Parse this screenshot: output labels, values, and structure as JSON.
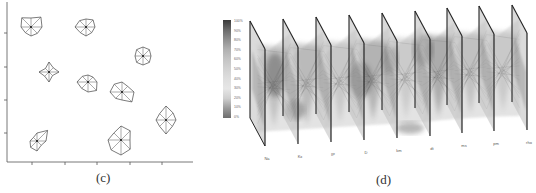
{
  "panels": {
    "c": {
      "label": "(c)",
      "type": "star-glyph scatter",
      "axes": {
        "x_ticks_px": [
          32,
          65,
          97,
          130,
          162
        ],
        "y_ticks_px": [
          33,
          67,
          100,
          133
        ]
      },
      "glyphs": [
        {
          "cx": 31,
          "cy": 27,
          "r": [
            9,
            14,
            11,
            9,
            9,
            8,
            10,
            13
          ]
        },
        {
          "cx": 86,
          "cy": 27,
          "r": [
            8,
            10,
            9,
            8,
            9,
            8,
            11,
            9
          ]
        },
        {
          "cx": 49,
          "cy": 72,
          "r": [
            10,
            6,
            10,
            5,
            10,
            6,
            10,
            5
          ]
        },
        {
          "cx": 88,
          "cy": 82,
          "r": [
            7,
            7,
            9,
            12,
            10,
            9,
            11,
            8
          ]
        },
        {
          "cx": 122,
          "cy": 92,
          "r": [
            10,
            8,
            12,
            14,
            8,
            9,
            12,
            11
          ]
        },
        {
          "cx": 143,
          "cy": 56,
          "r": [
            9,
            9,
            8,
            9,
            9,
            9,
            8,
            9
          ]
        },
        {
          "cx": 166,
          "cy": 120,
          "r": [
            14,
            10,
            10,
            9,
            14,
            9,
            10,
            9
          ]
        },
        {
          "cx": 37,
          "cy": 141,
          "r": [
            8,
            15,
            9,
            6,
            10,
            9,
            7,
            5
          ]
        },
        {
          "cx": 121,
          "cy": 140,
          "r": [
            14,
            13,
            9,
            13,
            15,
            14,
            13,
            10
          ]
        }
      ]
    },
    "d": {
      "label": "(d)",
      "type": "3D parallel coordinates with density planes",
      "legend": {
        "ticks": [
          "100%",
          "90%",
          "80%",
          "70%",
          "60%",
          "50%",
          "40%",
          "30%",
          "20%",
          "10%",
          "0%"
        ],
        "gradient": [
          "#3a3a3a",
          "#6a6a6a",
          "#8f8f8f",
          "#b0b0b0",
          "#c4c4c4",
          "#d2d2d2",
          "#dedede",
          "#e6e6e6",
          "#cfcfcf",
          "#9a9a9a",
          "#6e6e6e"
        ]
      },
      "axes": [
        {
          "label": "Na",
          "x": 250,
          "top": 21
        },
        {
          "label": "Kx",
          "x": 283,
          "top": 19
        },
        {
          "label": "IP",
          "x": 316,
          "top": 17
        },
        {
          "label": "D",
          "x": 349,
          "top": 15
        },
        {
          "label": "km",
          "x": 382,
          "top": 13
        },
        {
          "label": "dt",
          "x": 415,
          "top": 11
        },
        {
          "label": "ms",
          "x": 447,
          "top": 8
        },
        {
          "label": "pm",
          "x": 479,
          "top": 6
        },
        {
          "label": "rho",
          "x": 512,
          "top": 5
        }
      ],
      "plane_depth": {
        "dx": 15,
        "dy": 28
      },
      "plane_height": 97
    }
  }
}
